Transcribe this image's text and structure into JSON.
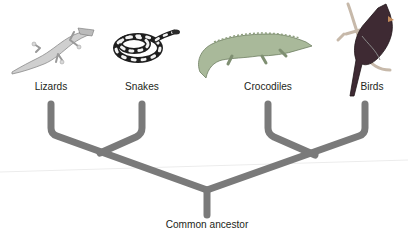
{
  "diagram": {
    "type": "cladogram",
    "taxa": [
      {
        "name": "Lizards",
        "icon": "lizard-icon",
        "x": 51
      },
      {
        "name": "Snakes",
        "icon": "snake-icon",
        "x": 142
      },
      {
        "name": "Crocodiles",
        "icon": "crocodile-icon",
        "x": 268
      },
      {
        "name": "Birds",
        "icon": "bird-icon",
        "x": 365
      }
    ],
    "root_label": "Common ancestor",
    "colors": {
      "branch": "#7a7a7a",
      "text": "#231f20",
      "bird_body": "#5a2a35",
      "crocodile": "#9bb08a",
      "lizard": "#c8c8c8",
      "snake_dark": "#222222"
    }
  }
}
